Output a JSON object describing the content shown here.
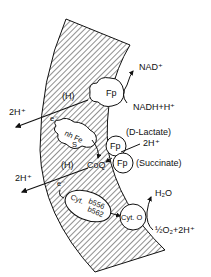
{
  "diagram": {
    "colors": {
      "ink": "#111111",
      "background": "#ffffff",
      "membrane_hatch": "#222222"
    },
    "labels": {
      "nad_plus": "NAD⁺",
      "nadh": "NADH+H⁺",
      "fp_top": "Fp",
      "h_top": "(H)",
      "two_h_top": "2H⁺",
      "e_top": "e⁻",
      "nhfe": "nh Fe",
      "s": "S",
      "d_lactate": "(D-Lactate)",
      "fp_lactate": "Fp",
      "two_h_mid": "2H⁺",
      "fp_succinate": "Fp",
      "succinate": "(Succinate)",
      "coq": "CoQ",
      "h_mid": "(H)",
      "two_h_left": "2H⁺",
      "e_mid": "e⁻",
      "cyt": "Cyt.",
      "b556": "b556",
      "b562": "b562",
      "cyt_o": "Cyt. O",
      "h2o": "H₂O",
      "o2": "½O₂+2H⁺"
    }
  }
}
